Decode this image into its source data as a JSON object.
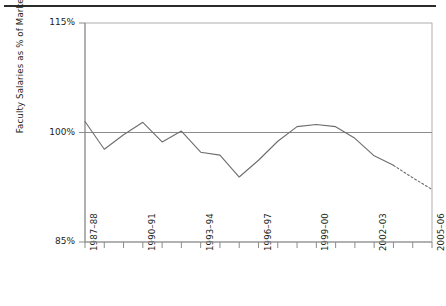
{
  "figure": {
    "ylabel": "Faculty Salaries as % of Market",
    "y_ticks": [
      {
        "label": "115%",
        "value": 115
      },
      {
        "label": "100%",
        "value": 100
      },
      {
        "label": "85%",
        "value": 85
      }
    ],
    "x_ticks": [
      {
        "label": "1987–88",
        "index": 0
      },
      {
        "label": "1990–91",
        "index": 3
      },
      {
        "label": "1993–94",
        "index": 6
      },
      {
        "label": "1996–97",
        "index": 9
      },
      {
        "label": "1999–00",
        "index": 12
      },
      {
        "label": "2002–03",
        "index": 15
      },
      {
        "label": "2005–06",
        "index": 18
      }
    ]
  },
  "chart_data": {
    "type": "line",
    "title": "",
    "xlabel": "",
    "ylabel": "Faculty Salaries as % of Market",
    "ylim": [
      85,
      115
    ],
    "grid": false,
    "legend": "none",
    "reference_line": {
      "value": 100,
      "label": "100%",
      "style": "solid"
    },
    "categories": [
      "1987–88",
      "1988–89",
      "1989–90",
      "1990–91",
      "1991–92",
      "1992–93",
      "1993–94",
      "1994–95",
      "1995–96",
      "1996–97",
      "1997–98",
      "1998–99",
      "1999–00",
      "2000–01",
      "2001–02",
      "2002–03",
      "2003–04",
      "2004–05",
      "2005–06"
    ],
    "series": [
      {
        "name": "Faculty Salaries as % of Market",
        "style": "solid",
        "values": [
          101.5,
          97.7,
          99.7,
          101.4,
          98.7,
          100.2,
          97.3,
          96.9,
          93.9,
          96.2,
          98.8,
          100.8,
          101.1,
          100.8,
          99.2,
          96.8,
          95.5,
          null,
          null
        ]
      },
      {
        "name": "Projected",
        "style": "dashed",
        "values": [
          null,
          null,
          null,
          null,
          null,
          null,
          null,
          null,
          null,
          null,
          null,
          null,
          null,
          null,
          null,
          null,
          95.5,
          93.8,
          92.2
        ]
      }
    ]
  }
}
